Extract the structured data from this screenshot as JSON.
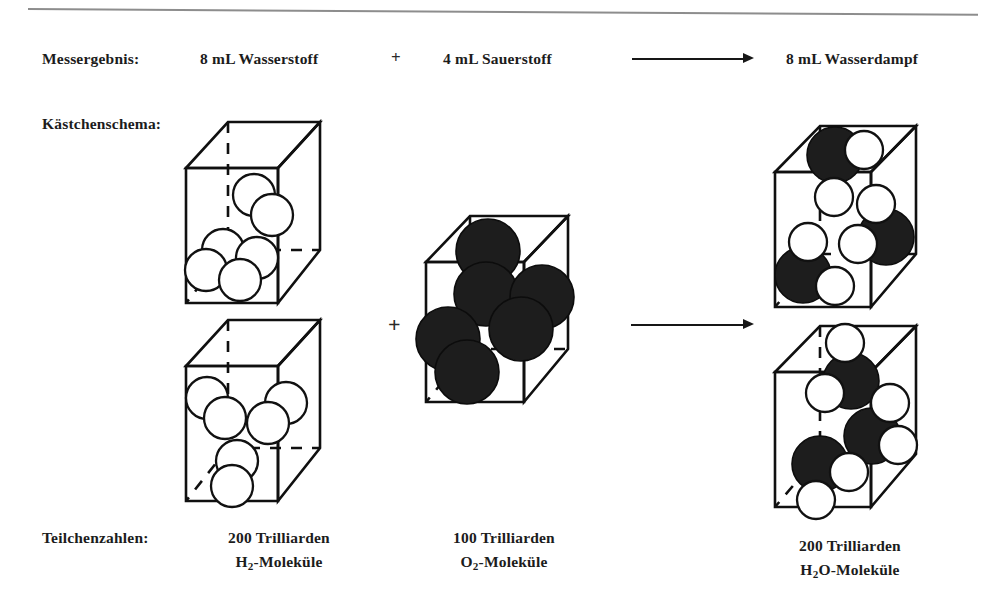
{
  "diagram": {
    "title_row_label": "Messergebnis:",
    "schema_row_label": "Kästchenschema:",
    "counts_row_label": "Teilchenzahlen:",
    "plus_top": "+",
    "plus_middle": "+",
    "measurement": {
      "reactant_1": "8 mL Wasserstoff",
      "reactant_2": "4 mL Sauerstoff",
      "product": "8 mL Wasserdampf"
    },
    "particle_counts": {
      "hydrogen_amount": "200 Trilliarden",
      "hydrogen_species": "H2-Moleküle",
      "oxygen_amount": "100 Trilliarden",
      "oxygen_species": "O2-Moleküle",
      "water_amount": "200 Trilliarden",
      "water_species": "H2O-Moleküle"
    },
    "colors": {
      "hydrogen_atom": "#ffffff",
      "oxygen_atom": "#1d1d1d",
      "line": "#101010",
      "text": "#1c1c1c",
      "rule": "#8d8d8d"
    },
    "boxes": [
      {
        "name": "hydrogen-box-top",
        "molecules": 3,
        "molecule": "H2"
      },
      {
        "name": "hydrogen-box-bottom",
        "molecules": 3,
        "molecule": "H2"
      },
      {
        "name": "oxygen-box",
        "molecules": 3,
        "molecule": "O2"
      },
      {
        "name": "water-box-top",
        "molecules": 3,
        "molecule": "H2O"
      },
      {
        "name": "water-box-bottom",
        "molecules": 3,
        "molecule": "H2O"
      }
    ]
  }
}
